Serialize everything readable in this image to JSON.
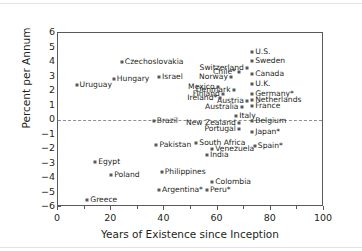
{
  "chart_data": {
    "type": "scatter",
    "title": "",
    "xlabel": "Years of Existence since Inception",
    "ylabel": "Percent per Annum",
    "xlim": [
      0,
      100
    ],
    "ylim": [
      -6,
      6
    ],
    "xticks": [
      0,
      20,
      40,
      60,
      80,
      100
    ],
    "yticks": [
      6,
      5,
      4,
      3,
      2,
      1,
      0,
      -1,
      -2,
      -3,
      -4,
      -5,
      -6
    ],
    "grid": false,
    "legend": null,
    "zero_reference_line": 0,
    "points": [
      {
        "label": "Uruguay",
        "x": 7,
        "y": 2.4,
        "side": "right"
      },
      {
        "label": "Hungary",
        "x": 21,
        "y": 2.8,
        "side": "right"
      },
      {
        "label": "Czechoslovakia",
        "x": 24,
        "y": 4.0,
        "side": "right"
      },
      {
        "label": "Israel",
        "x": 38,
        "y": 3.0,
        "side": "right"
      },
      {
        "label": "Brazil",
        "x": 36,
        "y": -0.1,
        "side": "right"
      },
      {
        "label": "Pakistan",
        "x": 37,
        "y": -1.7,
        "side": "right"
      },
      {
        "label": "Philippines",
        "x": 39,
        "y": -3.6,
        "side": "right"
      },
      {
        "label": "Argentina*",
        "x": 38,
        "y": -4.8,
        "side": "right"
      },
      {
        "label": "Egypt",
        "x": 14,
        "y": -2.9,
        "side": "right"
      },
      {
        "label": "Poland",
        "x": 20,
        "y": -3.8,
        "side": "right"
      },
      {
        "label": "Greece",
        "x": 11,
        "y": -5.5,
        "side": "right"
      },
      {
        "label": "Colombia",
        "x": 58,
        "y": -4.3,
        "side": "right"
      },
      {
        "label": "Peru*",
        "x": 56,
        "y": -4.8,
        "side": "right"
      },
      {
        "label": "India",
        "x": 56,
        "y": -2.4,
        "side": "right"
      },
      {
        "label": "South Africa",
        "x": 52,
        "y": -1.6,
        "side": "right"
      },
      {
        "label": "Venezuela",
        "x": 58,
        "y": -2.0,
        "side": "right"
      },
      {
        "label": "Spain*",
        "x": 74,
        "y": -1.8,
        "side": "right"
      },
      {
        "label": "New Zealand",
        "x": 68,
        "y": -0.2,
        "side": "left"
      },
      {
        "label": "Portugal",
        "x": 68,
        "y": -0.6,
        "side": "left"
      },
      {
        "label": "Japan*",
        "x": 73,
        "y": -0.8,
        "side": "right"
      },
      {
        "label": "Belgium",
        "x": 73,
        "y": -0.1,
        "side": "right"
      },
      {
        "label": "Italy",
        "x": 67,
        "y": 0.3,
        "side": "right"
      },
      {
        "label": "Australia",
        "x": 69,
        "y": 0.9,
        "side": "left"
      },
      {
        "label": "France",
        "x": 73,
        "y": 1.0,
        "side": "right"
      },
      {
        "label": "Austria",
        "x": 71,
        "y": 1.3,
        "side": "left"
      },
      {
        "label": "Netherlands",
        "x": 73,
        "y": 1.4,
        "side": "right"
      },
      {
        "label": "Ireland*",
        "x": 61,
        "y": 1.5,
        "side": "left"
      },
      {
        "label": "Finland",
        "x": 62,
        "y": 1.8,
        "side": "left"
      },
      {
        "label": "Germany*",
        "x": 73,
        "y": 1.8,
        "side": "right"
      },
      {
        "label": "Denmark",
        "x": 66,
        "y": 2.1,
        "side": "left"
      },
      {
        "label": "Mexico",
        "x": 60,
        "y": 2.3,
        "side": "left"
      },
      {
        "label": "U.K.",
        "x": 73,
        "y": 2.5,
        "side": "right"
      },
      {
        "label": "Norway",
        "x": 65,
        "y": 3.0,
        "side": "left"
      },
      {
        "label": "Chile*",
        "x": 68,
        "y": 3.3,
        "side": "left"
      },
      {
        "label": "Canada",
        "x": 73,
        "y": 3.2,
        "side": "right"
      },
      {
        "label": "Switzerland",
        "x": 71,
        "y": 3.6,
        "side": "left"
      },
      {
        "label": "Sweden",
        "x": 73,
        "y": 4.1,
        "side": "right"
      },
      {
        "label": "U.S.",
        "x": 73,
        "y": 4.7,
        "side": "right"
      }
    ]
  }
}
